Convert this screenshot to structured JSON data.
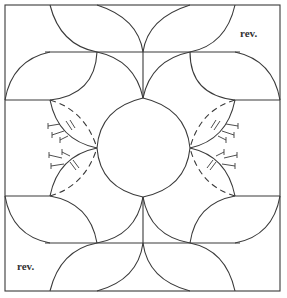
{
  "diagram": {
    "type": "quilt-block-pattern",
    "labels": {
      "top_right": "rev.",
      "bottom_left": "rev."
    },
    "line_color": "#3a3a3a",
    "background": "#ffffff",
    "notes": {
      "dashed_curves": "placement lines",
      "tack_marks": "stitch / tack indicators"
    }
  }
}
